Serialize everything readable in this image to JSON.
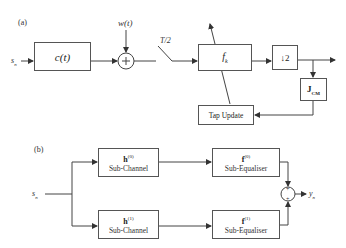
{
  "diagram_a": {
    "label": "(a)",
    "input": "s",
    "input_sub": "n",
    "channel": "c(t)",
    "noise": "w(t)",
    "sampler": "T/2",
    "equalizer": "f",
    "equalizer_sub": "k",
    "downsample": "↓2",
    "cost": "J",
    "cost_sub": "CM",
    "tap_update": "Tap Update"
  },
  "diagram_b": {
    "label": "(b)",
    "input": "s",
    "input_sub": "n",
    "output": "y",
    "output_sub": "n",
    "branches": [
      {
        "channel_sym": "h",
        "channel_sup": "(0)",
        "channel_label": "Sub-Channel",
        "eq_sym": "f",
        "eq_sup": "(0)",
        "eq_label": "Sub-Equaliser"
      },
      {
        "channel_sym": "h",
        "channel_sup": "(1)",
        "channel_label": "Sub-Channel",
        "eq_sym": "f",
        "eq_sup": "(1)",
        "eq_label": "Sub-Equaliser"
      }
    ],
    "sum_signs": [
      "+",
      "+"
    ]
  }
}
